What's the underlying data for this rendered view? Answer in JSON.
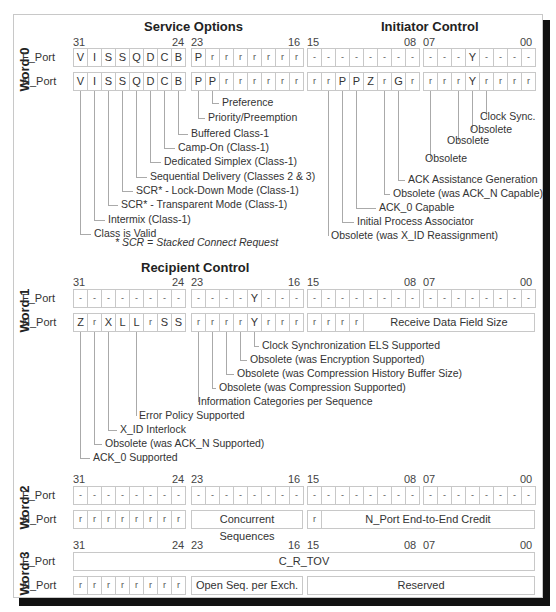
{
  "bit_numbers": {
    "b31": "31",
    "b24": "24",
    "b23": "23",
    "b16": "16",
    "b15": "15",
    "b08": "08",
    "b07": "07",
    "b00": "00"
  },
  "ports": {
    "f": "F_Port",
    "n": "N_Port"
  },
  "word0": {
    "label": "Word 0",
    "titles": {
      "service": "Service Options",
      "initiator": "Initiator Control"
    },
    "f_row": [
      "V",
      "I",
      "S",
      "S",
      "Q",
      "D",
      "C",
      "B",
      "P",
      "r",
      "r",
      "r",
      "r",
      "r",
      "r",
      "r",
      "-",
      "-",
      "-",
      "-",
      "-",
      "-",
      "-",
      "-",
      "-",
      "-",
      "-",
      "Y",
      "-",
      "-",
      "-",
      "-"
    ],
    "n_row": [
      "V",
      "I",
      "S",
      "S",
      "Q",
      "D",
      "C",
      "B",
      "P",
      "P",
      "r",
      "r",
      "r",
      "r",
      "r",
      "r",
      "r",
      "r",
      "P",
      "P",
      "Z",
      "r",
      "G",
      "r",
      "r",
      "r",
      "r",
      "Y",
      "r",
      "r",
      "r",
      "r"
    ],
    "service_labels": [
      "Preference",
      "Priority/Preemption",
      "Buffered Class-1",
      "Camp-On (Class-1)",
      "Dedicated Simplex (Class-1)",
      "Sequential Delivery (Classes 2 & 3)",
      "SCR* - Lock-Down Mode (Class-1)",
      "SCR* - Transparent Mode (Class-1)",
      "Intermix (Class-1)",
      "Class is Valid"
    ],
    "initiator_labels": [
      "Clock Sync.",
      "Obsolete",
      "Obsolete",
      "Obsolete",
      "ACK Assistance Generation",
      "Obsolete (was ACK_N Capable)",
      "ACK_0 Capable",
      "Initial Process Associator",
      "Obsolete (was X_ID Reassignment)"
    ],
    "footnote": "* SCR = Stacked Connect Request"
  },
  "word1": {
    "label": "Word 1",
    "title": "Recipient Control",
    "f_row": [
      "-",
      "-",
      "-",
      "-",
      "-",
      "-",
      "-",
      "-",
      "-",
      "-",
      "-",
      "-",
      "Y",
      "-",
      "-",
      "-",
      "-",
      "-",
      "-",
      "-",
      "-",
      "-",
      "-",
      "-",
      "-",
      "-",
      "-",
      "-",
      "-",
      "-",
      "-",
      "-"
    ],
    "n_row_bits": [
      "Z",
      "r",
      "X",
      "L",
      "L",
      "r",
      "S",
      "S",
      "r",
      "r",
      "r",
      "r",
      "Y",
      "r",
      "r",
      "r",
      "r",
      "r",
      "r",
      "r"
    ],
    "n_field": "Receive Data Field Size",
    "labels": [
      "Clock Synchronization ELS Supported",
      "Obsolete (was Encryption Supported)",
      "Obsolete (was Compression History Buffer Size)",
      "Obsolete (was Compression Supported)",
      "Information Categories per Sequence",
      "Error Policy Supported",
      "X_ID Interlock",
      "Obsolete (was ACK_N Supported)",
      "ACK_0 Supported"
    ]
  },
  "word2": {
    "label": "Word 2",
    "f_row": [
      "-",
      "-",
      "-",
      "-",
      "-",
      "-",
      "-",
      "-",
      "-",
      "-",
      "-",
      "-",
      "-",
      "-",
      "-",
      "-",
      "-",
      "-",
      "-",
      "-",
      "-",
      "-",
      "-",
      "-",
      "-",
      "-",
      "-",
      "-",
      "-",
      "-",
      "-",
      "-"
    ],
    "n_row_bits": [
      "r",
      "r",
      "r",
      "r",
      "r",
      "r",
      "r",
      "r"
    ],
    "n_field1": "Concurrent Sequences",
    "n_bit15": "r",
    "n_field2": "N_Port End-to-End Credit"
  },
  "word3": {
    "label": "Word 3",
    "f_field": "C_R_TOV",
    "n_row_bits": [
      "r",
      "r",
      "r",
      "r",
      "r",
      "r",
      "r",
      "r"
    ],
    "n_field1": "Open Seq. per Exch.",
    "n_field2": "Reserved"
  }
}
